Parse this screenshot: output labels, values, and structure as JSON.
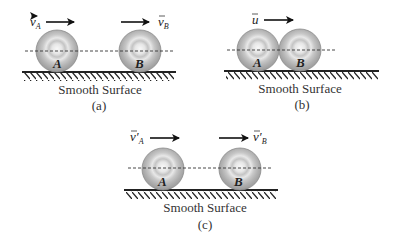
{
  "diagram": {
    "colors": {
      "ball_outer": "#a9a9a9",
      "ball_ring": "#d0d0d0",
      "ball_center": "#f5f5f5",
      "ground": "#222222",
      "dashed_line": "#333333",
      "text": "#333333"
    },
    "panels": [
      {
        "id": "a",
        "caption": "(a)",
        "surface_label": "Smooth Surface",
        "balls": [
          {
            "label": "A",
            "cx": 57,
            "cy": 51,
            "r": 21
          },
          {
            "label": "B",
            "cx": 140,
            "cy": 51,
            "r": 21
          }
        ],
        "arrows": [
          {
            "symbol": "v",
            "subscript": "A",
            "prime": "",
            "label_side": "left"
          },
          {
            "symbol": "v",
            "subscript": "B",
            "prime": "",
            "label_side": "right"
          }
        ]
      },
      {
        "id": "b",
        "caption": "(b)",
        "surface_label": "Smooth Surface",
        "balls": [
          {
            "label": "A",
            "cx": 258,
            "cy": 50,
            "r": 21
          },
          {
            "label": "B",
            "cx": 300,
            "cy": 50,
            "r": 21
          }
        ],
        "arrows": [
          {
            "symbol": "u",
            "subscript": "",
            "prime": "",
            "label_side": "left"
          }
        ]
      },
      {
        "id": "c",
        "caption": "(c)",
        "surface_label": "Smooth Surface",
        "balls": [
          {
            "label": "A",
            "cx": 163,
            "cy": 169,
            "r": 21
          },
          {
            "label": "B",
            "cx": 240,
            "cy": 169,
            "r": 21
          }
        ],
        "arrows": [
          {
            "symbol": "v",
            "subscript": "A",
            "prime": "′",
            "label_side": "left"
          },
          {
            "symbol": "v",
            "subscript": "B",
            "prime": "′",
            "label_side": "right"
          }
        ]
      }
    ]
  },
  "text": {
    "a_caption": "(a)",
    "b_caption": "(b)",
    "c_caption": "(c)",
    "surface": "Smooth Surface",
    "ball_a": "A",
    "ball_b": "B",
    "v": "v",
    "u": "u",
    "sub_a": "A",
    "sub_b": "B",
    "prime": "′"
  }
}
